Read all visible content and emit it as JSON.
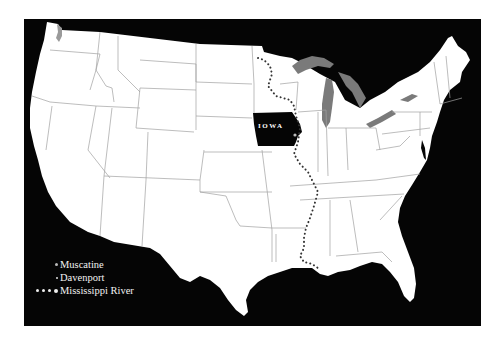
{
  "map": {
    "title": "",
    "background_color": "#050505",
    "land_color": "#ffffff",
    "border_color": "#9a9a9a",
    "lake_color": "#7a7a7a",
    "highlight": {
      "state": "IOWA",
      "fill": "#050505",
      "label_color": "#ffffff"
    },
    "river": {
      "name": "Mississippi River",
      "style": "dotted",
      "color": "#333333"
    }
  },
  "legend": {
    "items": [
      {
        "symbol": "small-gray-dot",
        "label": "Muscatine"
      },
      {
        "symbol": "tiny-dot",
        "label": "Davenport"
      },
      {
        "symbol": "dotted-line",
        "label": "Mississippi River"
      }
    ]
  }
}
